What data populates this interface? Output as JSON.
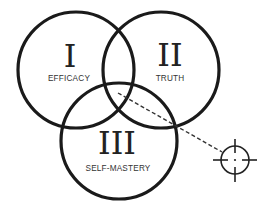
{
  "diagram": {
    "type": "venn",
    "colors": {
      "background": "#ffffff",
      "stroke": "#1a1a1a",
      "text": "#333333",
      "numeral": "#222222"
    },
    "circles": [
      {
        "id": "I",
        "numeral": "I",
        "label": "EFFICACY",
        "cx": 76,
        "cy": 70,
        "r": 58
      },
      {
        "id": "II",
        "numeral": "II",
        "label": "TRUTH",
        "cx": 161,
        "cy": 70,
        "r": 58
      },
      {
        "id": "III",
        "numeral": "III",
        "label": "SELF-MASTERY",
        "cx": 119,
        "cy": 141,
        "r": 58
      }
    ],
    "pointer": {
      "style": "dashed",
      "from": {
        "x": 118,
        "y": 93
      },
      "to": {
        "x": 222,
        "y": 152
      }
    },
    "target": {
      "icon": "crosshair-icon",
      "cx": 235,
      "cy": 160,
      "r": 14
    }
  }
}
